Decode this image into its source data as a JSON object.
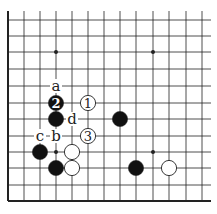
{
  "diagram": {
    "type": "go-board-fragment",
    "grid": {
      "columns_x": [
        8,
        24,
        40,
        56,
        72,
        88,
        104,
        120,
        136,
        153,
        169,
        186,
        202
      ],
      "rows_y": [
        20,
        36,
        52,
        69,
        86,
        103,
        119,
        136,
        152,
        168,
        185,
        201
      ],
      "top_extend": 11,
      "right_extend": 211,
      "left_edge": true,
      "bottom_edge": true
    },
    "star_points": [
      [
        3,
        2
      ],
      [
        9,
        2
      ],
      [
        3,
        8
      ],
      [
        9,
        8
      ]
    ],
    "stones": [
      {
        "col": 3,
        "row": 5,
        "color": "black",
        "label": "2"
      },
      {
        "col": 5,
        "row": 5,
        "color": "white",
        "label": "1"
      },
      {
        "col": 3,
        "row": 6,
        "color": "black",
        "label": ""
      },
      {
        "col": 7,
        "row": 6,
        "color": "black",
        "label": ""
      },
      {
        "col": 5,
        "row": 7,
        "color": "white",
        "label": "3"
      },
      {
        "col": 2,
        "row": 8,
        "color": "black",
        "label": ""
      },
      {
        "col": 4,
        "row": 8,
        "color": "white",
        "label": ""
      },
      {
        "col": 3,
        "row": 9,
        "color": "black",
        "label": ""
      },
      {
        "col": 4,
        "row": 9,
        "color": "white",
        "label": ""
      },
      {
        "col": 8,
        "row": 9,
        "color": "black",
        "label": ""
      },
      {
        "col": 10,
        "row": 9,
        "color": "white",
        "label": ""
      }
    ],
    "point_labels": [
      {
        "col": 3,
        "row": 4,
        "text": "a"
      },
      {
        "col": 3,
        "row": 7,
        "text": "b"
      },
      {
        "col": 2,
        "row": 7,
        "text": "c"
      },
      {
        "col": 4,
        "row": 6,
        "text": "d"
      }
    ],
    "colors": {
      "line": "#222222",
      "black_stone": "#111111",
      "white_stone": "#ffffff",
      "background": "#ffffff"
    }
  }
}
